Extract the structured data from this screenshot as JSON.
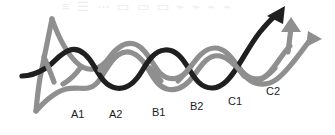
{
  "figure": {
    "background_color": "#ffffff",
    "width": 335,
    "height": 135
  },
  "colors": {
    "dark_strand": "#1f1f1f",
    "gray_strand": "#8f8f8f",
    "label_text": "#1c1c1c",
    "ghost_text": "#ededed"
  },
  "strands": {
    "dark": {
      "name": "dark-strand",
      "color": "#1f1f1f",
      "width": 5.2,
      "terminator": "arrow",
      "arrow_direction": "up-right"
    },
    "gray_wave": {
      "name": "gray-wave-strand",
      "color": "#8f8f8f",
      "width": 5.2,
      "terminator": "arrow",
      "arrow_direction": "up"
    },
    "gray_diagonal": {
      "name": "gray-diagonal-strand",
      "color": "#8f8f8f",
      "width": 5.2,
      "terminator": "arrow",
      "arrow_direction": "right"
    }
  },
  "labels": [
    {
      "text": "A1",
      "x": 71,
      "y": 108
    },
    {
      "text": "A2",
      "x": 109,
      "y": 108
    },
    {
      "text": "B1",
      "x": 152,
      "y": 106
    },
    {
      "text": "B2",
      "x": 190,
      "y": 100
    },
    {
      "text": "C1",
      "x": 228,
      "y": 95
    },
    {
      "text": "C2",
      "x": 266,
      "y": 85
    }
  ],
  "ghost_text": "≡  ☰  ⋯   ▭ ▭ ▭  ⌁ ⌁ ⌁ ⌁",
  "arrows": [
    {
      "name": "dark-arrow-head",
      "direction": "up-right",
      "color": "#1f1f1f",
      "x": 277,
      "y": 14
    },
    {
      "name": "gray-arrow-head-up",
      "direction": "up",
      "color": "#8f8f8f",
      "x": 292,
      "y": 22
    },
    {
      "name": "gray-arrow-head-right",
      "direction": "right",
      "color": "#8f8f8f",
      "x": 312,
      "y": 37
    }
  ]
}
